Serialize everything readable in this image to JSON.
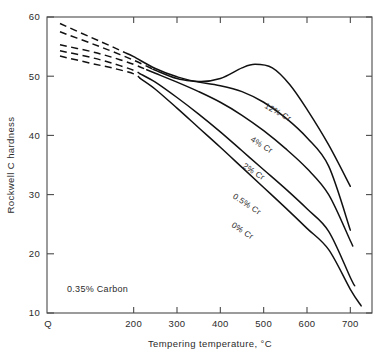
{
  "chart_data": {
    "type": "line",
    "title": "",
    "xlabel": "Tempering temperature, °C",
    "ylabel": "Rockwell C hardness",
    "xlim": [
      0,
      750
    ],
    "ylim": [
      10,
      60
    ],
    "x_origin_label": "Q",
    "xticks": [
      200,
      300,
      400,
      500,
      600,
      700
    ],
    "xtick_labels": [
      "200",
      "300",
      "400",
      "500",
      "600",
      "700"
    ],
    "yticks": [
      10,
      20,
      30,
      40,
      50,
      60
    ],
    "ytick_labels": [
      "10",
      "20",
      "30",
      "40",
      "50",
      "60"
    ],
    "grid": false,
    "legend_position": "inline-curve-labels",
    "annotation": "0.35% Carbon",
    "series": [
      {
        "name": "0% Cr",
        "label": "0% Cr",
        "dashed_head_until_x": 215,
        "x": [
          30,
          100,
          150,
          200,
          250,
          300,
          350,
          400,
          450,
          500,
          550,
          600,
          650,
          700,
          725
        ],
        "values": [
          53.4,
          52.2,
          51.4,
          50.4,
          47.8,
          44.6,
          41.3,
          38.0,
          34.6,
          31.2,
          27.8,
          24.3,
          20.7,
          14.0,
          11.2
        ]
      },
      {
        "name": "0.5% Cr",
        "label": "0.5% Cr",
        "dashed_head_until_x": 215,
        "x": [
          30,
          100,
          150,
          200,
          250,
          300,
          350,
          400,
          450,
          500,
          550,
          600,
          650,
          700,
          710
        ],
        "values": [
          54.3,
          53.2,
          52.2,
          51.0,
          49.0,
          46.4,
          43.6,
          40.6,
          37.4,
          34.2,
          31.0,
          27.6,
          23.8,
          16.0,
          14.6
        ]
      },
      {
        "name": "2% Cr",
        "label": "2% Cr",
        "dashed_head_until_x": 230,
        "x": [
          30,
          100,
          150,
          200,
          250,
          300,
          350,
          400,
          450,
          500,
          550,
          600,
          650,
          700,
          705
        ],
        "values": [
          55.3,
          54.2,
          53.2,
          52.0,
          50.5,
          49.0,
          47.4,
          45.6,
          43.4,
          40.8,
          37.8,
          34.4,
          30.0,
          22.2,
          21.4
        ]
      },
      {
        "name": "4% Cr",
        "label": "4% Cr",
        "dashed_head_until_x": 245,
        "x": [
          30,
          100,
          150,
          200,
          250,
          300,
          350,
          400,
          450,
          500,
          550,
          600,
          650,
          700
        ],
        "values": [
          57.5,
          55.6,
          54.2,
          52.7,
          51.0,
          49.6,
          49.0,
          48.4,
          47.4,
          45.6,
          43.0,
          39.6,
          34.8,
          24.0
        ]
      },
      {
        "name": "12% Cr",
        "label": "12% Cr",
        "dashed_head_until_x": 180,
        "x": [
          30,
          100,
          150,
          200,
          250,
          300,
          350,
          400,
          450,
          480,
          520,
          560,
          600,
          650,
          700
        ],
        "values": [
          58.9,
          56.6,
          55.0,
          53.3,
          51.3,
          49.9,
          49.1,
          49.6,
          51.4,
          52.0,
          51.4,
          48.6,
          44.4,
          38.4,
          31.4
        ]
      }
    ],
    "curve_label_positions": [
      {
        "series": "12% Cr",
        "x": 530,
        "y": 43.5,
        "rotate": 29
      },
      {
        "series": "4% Cr",
        "x": 492,
        "y": 38.0,
        "rotate": 32
      },
      {
        "series": "2% Cr",
        "x": 474,
        "y": 33.5,
        "rotate": 33
      },
      {
        "series": "0.5% Cr",
        "x": 458,
        "y": 28.0,
        "rotate": 33
      },
      {
        "series": "0% Cr",
        "x": 448,
        "y": 23.5,
        "rotate": 33
      }
    ]
  }
}
